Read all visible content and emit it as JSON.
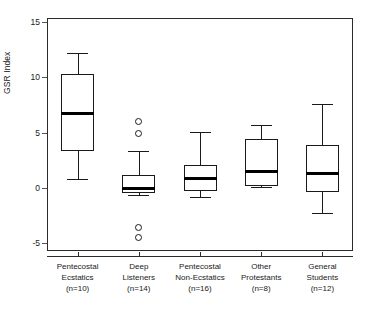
{
  "chart_data": {
    "type": "box",
    "title": "",
    "xlabel": "",
    "ylabel": "GSR Index",
    "ylim": [
      -7,
      16.5
    ],
    "yticks": [
      15,
      10,
      5,
      0,
      -5
    ],
    "ytick_labels": [
      "15",
      "10",
      "5",
      "0",
      "-5"
    ],
    "grid": false,
    "legend": "none",
    "categories": [
      "Pentecostal Ecstatics (n=10)",
      "Deep Listeners (n=14)",
      "Pentecostal Non-Ecstatics (n=16)",
      "Other Protestants (n=8)",
      "General Students (n=12)"
    ],
    "category_lines": [
      [
        "Pentecostal",
        "Ecstatics",
        "(n=10)"
      ],
      [
        "Deep",
        "Listeners",
        "(n=14)"
      ],
      [
        "Pentecostal",
        "Non-Ecstatics",
        "(n=16)"
      ],
      [
        "Other",
        "Protestants",
        "(n=8)"
      ],
      [
        "General",
        "Students",
        "(n=12)"
      ]
    ],
    "n": [
      10,
      14,
      16,
      8,
      12
    ],
    "boxes": [
      {
        "label": "Pentecostal Ecstatics",
        "n": 10,
        "whisker_low": 0.8,
        "q1": 3.3,
        "median": 6.7,
        "q3": 10.3,
        "whisker_high": 12.2,
        "outliers": []
      },
      {
        "label": "Deep Listeners",
        "n": 14,
        "whisker_low": -0.6,
        "q1": -0.45,
        "median": -0.05,
        "q3": 1.15,
        "whisker_high": 3.3,
        "outliers": [
          6.0,
          4.9,
          -3.6,
          -4.5
        ]
      },
      {
        "label": "Pentecostal Non-Ecstatics",
        "n": 16,
        "whisker_low": -0.85,
        "q1": -0.25,
        "median": 0.9,
        "q3": 2.1,
        "whisker_high": 5.1,
        "outliers": []
      },
      {
        "label": "Other Protestants",
        "n": 8,
        "whisker_low": 0.05,
        "q1": 0.15,
        "median": 1.5,
        "q3": 4.4,
        "whisker_high": 5.7,
        "outliers": []
      },
      {
        "label": "General Students",
        "n": 12,
        "whisker_low": -2.3,
        "q1": -0.4,
        "median": 1.3,
        "q3": 3.9,
        "whisker_high": 7.6,
        "outliers": []
      }
    ],
    "colors": {
      "line": "#1a1a1a",
      "median": "#000000",
      "fill": "#ffffff",
      "axis": "#2b2b2b",
      "background": "#ffffff"
    }
  }
}
